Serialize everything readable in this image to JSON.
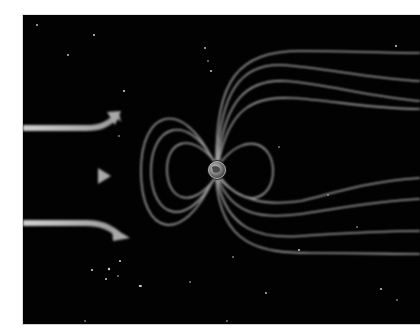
{
  "illustration": {
    "subject": "Earth's magnetosphere deflecting the solar wind",
    "background_color": "#020202",
    "page_color": "#ffffff",
    "line_color": "#bdbdbd",
    "arrow_color": "#c4c4c4",
    "planet": {
      "name": "earth",
      "cx": 216,
      "cy": 169,
      "r": 9
    },
    "solar_wind_arrows": [
      {
        "id": "upper",
        "direction": "curving-up",
        "y": 124
      },
      {
        "id": "middle",
        "direction": "straight",
        "y": 175
      },
      {
        "id": "lower",
        "direction": "curving-down",
        "y": 222
      }
    ],
    "icons": [
      "solar-wind-arrow-icon",
      "earth-icon",
      "star-icon"
    ]
  }
}
